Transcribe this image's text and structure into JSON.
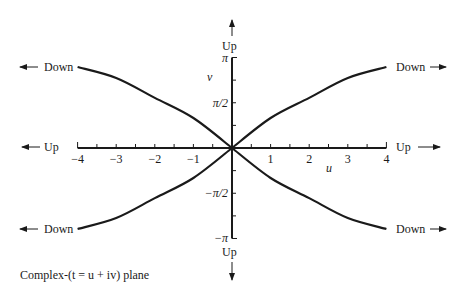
{
  "diagram": {
    "caption": "Complex-(t = u + iv) plane",
    "x_axis_label": "u",
    "y_axis_label": "v",
    "x_ticks": [
      "-4",
      "-3",
      "-2",
      "-1",
      "1",
      "2",
      "3",
      "4"
    ],
    "x_tick_values": [
      -4,
      -3,
      -2,
      -1,
      1,
      2,
      3,
      4
    ],
    "y_ticks": [
      "π",
      "π/2",
      "−π/2",
      "−π"
    ],
    "y_tick_values": [
      3.14159,
      1.5708,
      -1.5708,
      -3.14159
    ],
    "x_range": [
      -4,
      4
    ],
    "y_range": [
      -3.14159,
      3.14159
    ],
    "direction_labels": {
      "top": "Up",
      "bottom": "Up",
      "left_axis": "Up",
      "right_axis": "Up",
      "upper_left": "Down",
      "lower_left": "Down",
      "upper_right": "Down",
      "lower_right": "Down"
    },
    "curves": [
      {
        "name": "upper-right",
        "points": [
          [
            0,
            0
          ],
          [
            1,
            1.04
          ],
          [
            2,
            1.74
          ],
          [
            3,
            2.43
          ],
          [
            4,
            2.81
          ]
        ]
      },
      {
        "name": "lower-right",
        "points": [
          [
            0,
            0
          ],
          [
            1,
            -1.04
          ],
          [
            2,
            -1.74
          ],
          [
            3,
            -2.43
          ],
          [
            4,
            -2.81
          ]
        ]
      },
      {
        "name": "upper-left",
        "points": [
          [
            0,
            0
          ],
          [
            -1,
            1.04
          ],
          [
            -2,
            1.74
          ],
          [
            -3,
            2.43
          ],
          [
            -4,
            2.81
          ]
        ]
      },
      {
        "name": "lower-left",
        "points": [
          [
            0,
            0
          ],
          [
            -1,
            -1.04
          ],
          [
            -2,
            -1.74
          ],
          [
            -3,
            -2.43
          ],
          [
            -4,
            -2.81
          ]
        ]
      }
    ]
  }
}
